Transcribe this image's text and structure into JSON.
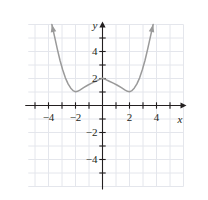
{
  "figure": {
    "width": 208,
    "height": 200,
    "background": "#ffffff"
  },
  "axis_labels": {
    "x_label": "x",
    "y_label": "y"
  },
  "colors": {
    "grid": "#e4e6ec",
    "axis": "#231f20",
    "curve": "#9a9a9a",
    "text": "#231f20"
  },
  "chart_data": {
    "type": "line",
    "title": "",
    "subtitle": "",
    "xlabel": "x",
    "ylabel": "y",
    "xlim": [
      -5.5,
      6.0
    ],
    "ylim": [
      -6.0,
      6.0
    ],
    "grid": true,
    "grid_spacing": 1,
    "legend": "none",
    "x_ticks": [
      -5,
      -4,
      -3,
      -2,
      -1,
      1,
      2,
      3,
      4,
      5
    ],
    "x_tick_labels": [
      "",
      "-4",
      "",
      "-2",
      "",
      "",
      "2",
      "",
      "4",
      ""
    ],
    "x_labeled_ticks": [
      {
        "value": -4,
        "label": "−4"
      },
      {
        "value": -2,
        "label": "−2"
      },
      {
        "value": 2,
        "label": "2"
      },
      {
        "value": 4,
        "label": "4"
      }
    ],
    "y_ticks": [
      -5,
      -4,
      -3,
      -2,
      -1,
      1,
      2,
      3,
      4,
      5
    ],
    "y_labeled_ticks": [
      {
        "value": 4,
        "label": "4"
      },
      {
        "value": 2,
        "label": "2"
      },
      {
        "value": -2,
        "label": "−2"
      },
      {
        "value": -4,
        "label": "−4"
      }
    ],
    "series": [
      {
        "name": "curve",
        "color": "#9a9a9a",
        "arrow_start": true,
        "arrow_end": true,
        "description": "W-shaped even curve with a cusp local maximum at (0, 2), local minima near (±2, 1), rising steeply to arrowheads near (±3.75, 6)",
        "points": [
          [
            -3.75,
            6.0
          ],
          [
            -3.55,
            5.1
          ],
          [
            -3.35,
            4.2
          ],
          [
            -3.15,
            3.35
          ],
          [
            -2.95,
            2.65
          ],
          [
            -2.75,
            2.05
          ],
          [
            -2.55,
            1.6
          ],
          [
            -2.35,
            1.28
          ],
          [
            -2.15,
            1.08
          ],
          [
            -2.0,
            1.02
          ],
          [
            -1.85,
            1.05
          ],
          [
            -1.65,
            1.16
          ],
          [
            -1.4,
            1.32
          ],
          [
            -1.1,
            1.5
          ],
          [
            -0.8,
            1.66
          ],
          [
            -0.5,
            1.8
          ],
          [
            -0.25,
            1.92
          ],
          [
            0.0,
            2.02
          ],
          [
            0.25,
            1.92
          ],
          [
            0.5,
            1.8
          ],
          [
            0.8,
            1.66
          ],
          [
            1.1,
            1.5
          ],
          [
            1.4,
            1.32
          ],
          [
            1.65,
            1.16
          ],
          [
            1.85,
            1.05
          ],
          [
            2.0,
            1.02
          ],
          [
            2.15,
            1.08
          ],
          [
            2.35,
            1.28
          ],
          [
            2.55,
            1.6
          ],
          [
            2.75,
            2.05
          ],
          [
            2.95,
            2.65
          ],
          [
            3.15,
            3.35
          ],
          [
            3.35,
            4.2
          ],
          [
            3.55,
            5.1
          ],
          [
            3.75,
            6.0
          ]
        ]
      }
    ]
  }
}
